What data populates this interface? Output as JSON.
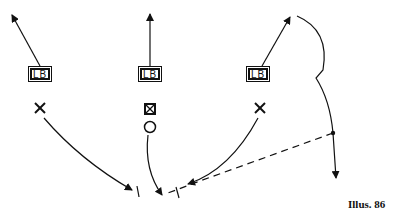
{
  "diagram": {
    "caption": "Illus. 86",
    "linebackers": [
      {
        "label": "LB"
      },
      {
        "label": "LB"
      },
      {
        "label": "LB"
      }
    ],
    "colors": {
      "ink": "#111111",
      "background": "#ffffff"
    }
  }
}
